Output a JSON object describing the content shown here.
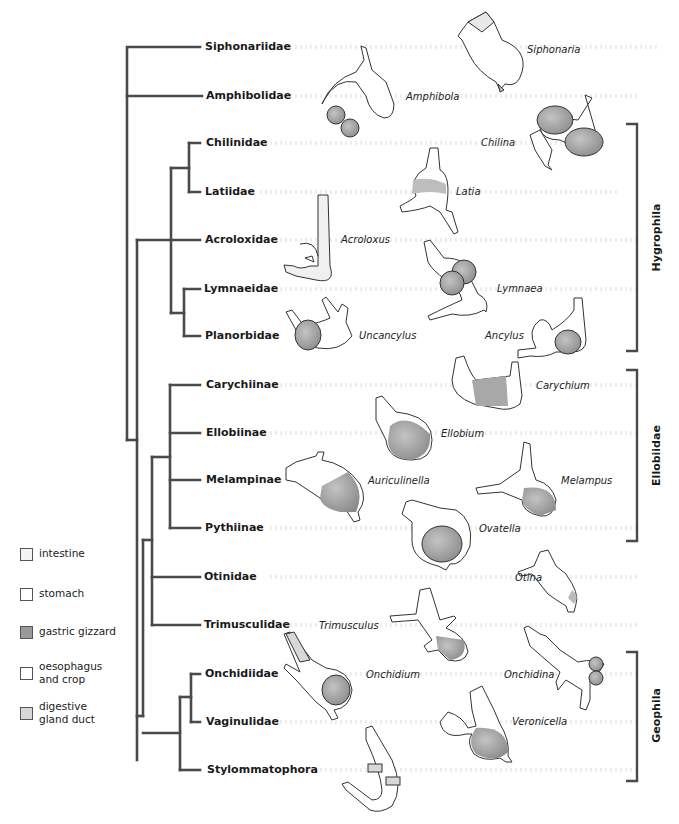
{
  "colors": {
    "tree_line": "#4a4a4a",
    "outline": "#333333",
    "intestine": "#f4f4f4",
    "stomach": "#ffffff",
    "gastric_gizzard": "#9a9a9a",
    "oesophagus_crop": "#ffffff",
    "digestive_gland_duct": "#d8d8d8"
  },
  "tree": {
    "taxa": [
      {
        "name": "Siphonariidae",
        "y": 47
      },
      {
        "name": "Amphibolidae",
        "y": 96
      },
      {
        "name": "Chilinidae",
        "y": 143
      },
      {
        "name": "Latiidae",
        "y": 192
      },
      {
        "name": "Acroloxidae",
        "y": 240
      },
      {
        "name": "Lymnaeidae",
        "y": 289
      },
      {
        "name": "Planorbidae",
        "y": 336
      },
      {
        "name": "Carychiinae",
        "y": 385
      },
      {
        "name": "Ellobiinae",
        "y": 433
      },
      {
        "name": "Melampinae",
        "y": 480
      },
      {
        "name": "Pythiinae",
        "y": 528
      },
      {
        "name": "Otinidae",
        "y": 577
      },
      {
        "name": "Trimusculidae",
        "y": 625
      },
      {
        "name": "Onchidiidae",
        "y": 674
      },
      {
        "name": "Vaginulidae",
        "y": 722
      },
      {
        "name": "Stylommatophora",
        "y": 770
      }
    ]
  },
  "genera": [
    {
      "name": "Siphonaria",
      "x": 527,
      "y": 44
    },
    {
      "name": "Amphibola",
      "x": 406,
      "y": 91
    },
    {
      "name": "Chilina",
      "x": 481,
      "y": 137
    },
    {
      "name": "Latia",
      "x": 456,
      "y": 186
    },
    {
      "name": "Acroloxus",
      "x": 341,
      "y": 234
    },
    {
      "name": "Lymnaea",
      "x": 497,
      "y": 283
    },
    {
      "name": "Uncancylus",
      "x": 359,
      "y": 330
    },
    {
      "name": "Ancylus",
      "x": 485,
      "y": 330
    },
    {
      "name": "Carychium",
      "x": 536,
      "y": 380
    },
    {
      "name": "Ellobium",
      "x": 441,
      "y": 428
    },
    {
      "name": "Auriculinella",
      "x": 368,
      "y": 475
    },
    {
      "name": "Melampus",
      "x": 561,
      "y": 475
    },
    {
      "name": "Ovatella",
      "x": 479,
      "y": 523
    },
    {
      "name": "Otina",
      "x": 515,
      "y": 572
    },
    {
      "name": "Trimusculus",
      "x": 319,
      "y": 620
    },
    {
      "name": "Onchidium",
      "x": 366,
      "y": 669
    },
    {
      "name": "Onchidina",
      "x": 504,
      "y": 669
    },
    {
      "name": "Veronicella",
      "x": 512,
      "y": 716
    }
  ],
  "clades": [
    {
      "name": "Hygrophila",
      "top": 124,
      "bottom": 351
    },
    {
      "name": "Ellobiidae",
      "top": 370,
      "bottom": 541
    },
    {
      "name": "Geophila",
      "top": 652,
      "bottom": 781
    }
  ],
  "legend": [
    {
      "label_line1": "intestine",
      "label_line2": "",
      "key": "intestine"
    },
    {
      "label_line1": "stomach",
      "label_line2": "",
      "key": "stomach"
    },
    {
      "label_line1": "gastric gizzard",
      "label_line2": "",
      "key": "gastric_gizzard"
    },
    {
      "label_line1": "oesophagus",
      "label_line2": "and crop",
      "key": "oesophagus_crop"
    },
    {
      "label_line1": "digestive",
      "label_line2": "gland duct",
      "key": "digestive_gland_duct"
    }
  ]
}
